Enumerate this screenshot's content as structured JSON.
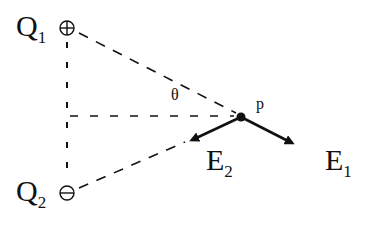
{
  "diagram": {
    "charges": [
      {
        "name": "Q",
        "subscript": "1",
        "symbol": "⊕",
        "sign": "positive"
      },
      {
        "name": "Q",
        "subscript": "2",
        "symbol": "⊖",
        "sign": "negative"
      }
    ],
    "point": {
      "label": "p"
    },
    "angle": {
      "label": "θ"
    },
    "fields": [
      {
        "name": "E",
        "subscript": "1"
      },
      {
        "name": "E",
        "subscript": "2"
      }
    ],
    "colors": {
      "ink": "#111111",
      "background": "#ffffff"
    }
  }
}
